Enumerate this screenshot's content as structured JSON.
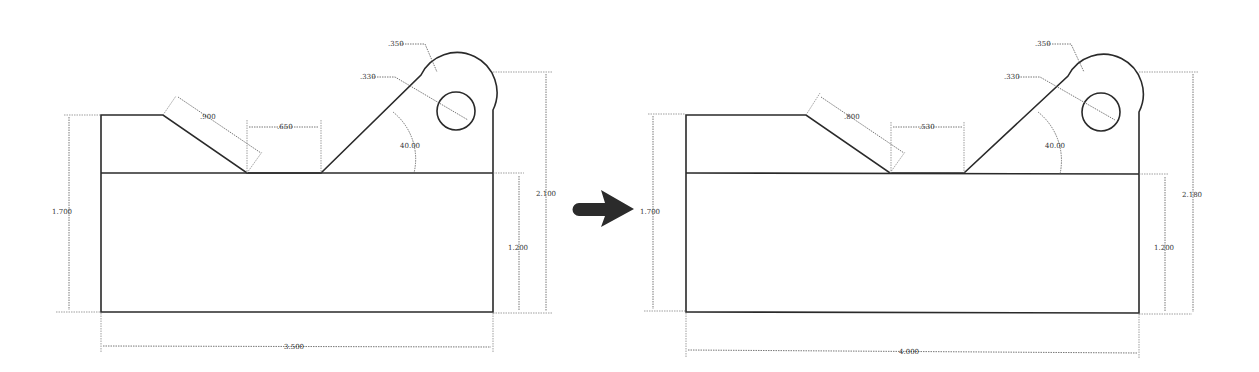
{
  "figure": {
    "type": "before-after engineering drawing comparison",
    "transition_icon": "right-arrow-icon"
  },
  "drawings": [
    {
      "id": "original",
      "dimensions": {
        "slope_length": ".900",
        "gap_width": ".650",
        "outer_radius": ".350",
        "hole_diameter": ".330",
        "angle": "40.00",
        "left_height": "1.700",
        "base_height": "1.200",
        "total_height": "2.100",
        "total_width": "3.500"
      }
    },
    {
      "id": "modified",
      "dimensions": {
        "slope_length": ".800",
        "gap_width": ".530",
        "outer_radius": ".350",
        "hole_diameter": ".330",
        "angle": "40.00",
        "left_height": "1.700",
        "base_height": "1.200",
        "total_height": "2.180",
        "total_width": "4.000"
      }
    }
  ]
}
